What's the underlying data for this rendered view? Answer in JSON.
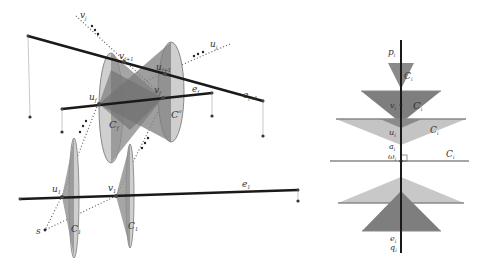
{
  "colors": {
    "edge": "#1a1a1a",
    "cone_light": "#c8c8c8",
    "cone_mid": "#9a9a9a",
    "cone_dark": "#7a7a7a",
    "cone_outline": "#8a8a8a",
    "dotted": "#555555",
    "plane_line": "#888888",
    "drop_line": "#bbbbbb",
    "point": "#333333"
  },
  "left_figure": {
    "edges": [
      {
        "id": "e_f+1",
        "label": "e",
        "sub": "f+1"
      },
      {
        "id": "e_f",
        "label": "e",
        "sub": "f"
      },
      {
        "id": "e_1",
        "label": "e",
        "sub": "1"
      }
    ],
    "vertices": [
      {
        "label": "v",
        "sub": "f+1"
      },
      {
        "label": "u",
        "sub": "f+1"
      },
      {
        "label": "u",
        "sub": "f"
      },
      {
        "label": "v",
        "sub": "f"
      },
      {
        "label": "u",
        "sub": "1"
      },
      {
        "label": "v",
        "sub": "1"
      }
    ],
    "rays": [
      {
        "label": "v",
        "sub": "j"
      },
      {
        "label": "u",
        "sub": "j"
      },
      {
        "label": "s",
        "sub": ""
      }
    ],
    "cones": [
      {
        "label": "C",
        "sub": "f",
        "sup": "u"
      },
      {
        "label": "C",
        "sub": "f",
        "sup": "v"
      },
      {
        "label": "C",
        "sub": "1",
        "sup": "u"
      },
      {
        "label": "C",
        "sub": "1",
        "sup": "v"
      }
    ]
  },
  "right_figure": {
    "axis_top": {
      "label": "p",
      "sub": "i"
    },
    "axis_bottom": [
      {
        "label": "e",
        "sub": "i"
      },
      {
        "label": "q",
        "sub": "i"
      }
    ],
    "points": [
      {
        "label": "v",
        "sub": "i"
      },
      {
        "label": "u",
        "sub": "i"
      },
      {
        "label": "a",
        "sub": "i"
      },
      {
        "label": "ω",
        "sub": "i"
      }
    ],
    "cones": [
      {
        "label": "C",
        "sub": "i",
        "sup": "1"
      },
      {
        "label": "C",
        "sub": "i",
        "sup": "v"
      },
      {
        "label": "C",
        "sub": "i",
        "sup": "u"
      },
      {
        "label": "C",
        "sub": "i",
        "sup": "ω"
      }
    ]
  }
}
